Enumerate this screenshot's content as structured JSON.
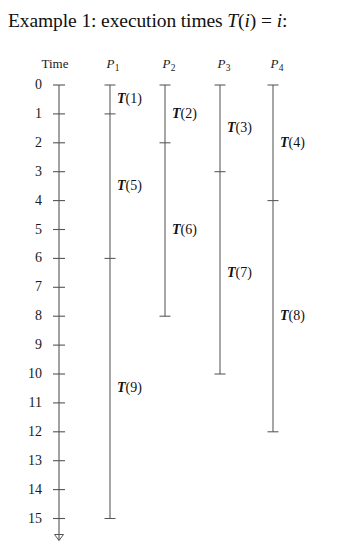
{
  "title": {
    "prefix": "Example 1: execution times ",
    "math_t": "T",
    "math_open": "(",
    "math_i": "i",
    "math_close": ")",
    "math_eq": " = ",
    "math_i2": "i",
    "math_colon": ":",
    "full_text": "Example 1: execution times T(i) = i:"
  },
  "headers": {
    "time": "Time",
    "processors": [
      {
        "base": "P",
        "sub": "1",
        "label": "P1"
      },
      {
        "base": "P",
        "sub": "2",
        "label": "P2"
      },
      {
        "base": "P",
        "sub": "3",
        "label": "P3"
      },
      {
        "base": "P",
        "sub": "4",
        "label": "P4"
      }
    ]
  },
  "axis": {
    "label": "Time",
    "min": 0,
    "max": 15,
    "ticks": [
      "0",
      "1",
      "2",
      "3",
      "4",
      "5",
      "6",
      "7",
      "8",
      "9",
      "10",
      "11",
      "12",
      "13",
      "14",
      "15"
    ],
    "has_arrow": true,
    "arrow_direction": "down"
  },
  "chart_data": {
    "type": "gantt",
    "title": "Example 1: execution times T(i) = i:",
    "xlabel": "",
    "ylabel": "Time",
    "ylim": [
      0,
      15
    ],
    "grid": false,
    "legend": "none",
    "categories": [
      "P1",
      "P2",
      "P3",
      "P4"
    ],
    "series": [
      {
        "name": "P1",
        "tasks": [
          {
            "label": "T(1)",
            "task_name": "T",
            "task_index": "1",
            "start": 0,
            "end": 1
          },
          {
            "label": "T(5)",
            "task_name": "T",
            "task_index": "5",
            "start": 1,
            "end": 6
          },
          {
            "label": "T(9)",
            "task_name": "T",
            "task_index": "9",
            "start": 6,
            "end": 15
          }
        ]
      },
      {
        "name": "P2",
        "tasks": [
          {
            "label": "T(2)",
            "task_name": "T",
            "task_index": "2",
            "start": 0,
            "end": 2
          },
          {
            "label": "T(6)",
            "task_name": "T",
            "task_index": "6",
            "start": 2,
            "end": 8
          }
        ]
      },
      {
        "name": "P3",
        "tasks": [
          {
            "label": "T(3)",
            "task_name": "T",
            "task_index": "3",
            "start": 0,
            "end": 3
          },
          {
            "label": "T(7)",
            "task_name": "T",
            "task_index": "7",
            "start": 3,
            "end": 10
          }
        ]
      },
      {
        "name": "P4",
        "tasks": [
          {
            "label": "T(4)",
            "task_name": "T",
            "task_index": "4",
            "start": 0,
            "end": 4
          },
          {
            "label": "T(8)",
            "task_name": "T",
            "task_index": "8",
            "start": 4,
            "end": 12
          }
        ]
      }
    ]
  },
  "colors": {
    "background": "#ffffff",
    "text": "#1a1a1a",
    "line": "#555555"
  }
}
